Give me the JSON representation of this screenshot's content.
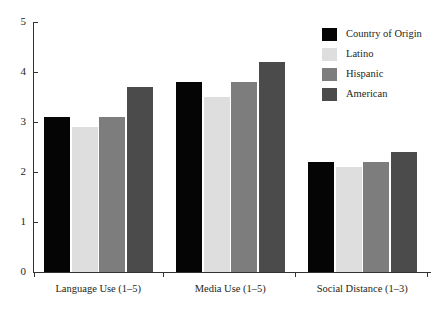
{
  "chart_data": {
    "type": "bar",
    "title": "",
    "xlabel": "",
    "ylabel": "",
    "ylim": [
      0,
      5
    ],
    "yticks": [
      0,
      1,
      2,
      3,
      4,
      5
    ],
    "ytick_labels": [
      "0",
      "1",
      "2",
      "3",
      "4",
      "5"
    ],
    "grid": false,
    "legend_position": "top-right",
    "categories": [
      "Language Use (1–5)",
      "Media Use (1–5)",
      "Social Distance (1–3)"
    ],
    "series": [
      {
        "name": "Country of Origin",
        "color": "#050505",
        "values": [
          3.1,
          3.8,
          2.2
        ]
      },
      {
        "name": "Latino",
        "color": "#dedede",
        "values": [
          2.9,
          3.5,
          2.1
        ]
      },
      {
        "name": "Hispanic",
        "color": "#7d7d7d",
        "values": [
          3.1,
          3.8,
          2.2
        ]
      },
      {
        "name": "American",
        "color": "#4b4b4b",
        "values": [
          3.7,
          4.2,
          2.4
        ]
      }
    ]
  },
  "legend": {
    "items": [
      {
        "label": "Country of Origin",
        "color": "#050505"
      },
      {
        "label": "Latino",
        "color": "#dedede"
      },
      {
        "label": "Hispanic",
        "color": "#7d7d7d"
      },
      {
        "label": "American",
        "color": "#4b4b4b"
      }
    ]
  },
  "axis": {
    "y_labels": [
      "0",
      "1",
      "2",
      "3",
      "4",
      "5"
    ],
    "x_labels": [
      "Language Use (1–5)",
      "Media Use (1–5)",
      "Social Distance (1–3)"
    ]
  }
}
